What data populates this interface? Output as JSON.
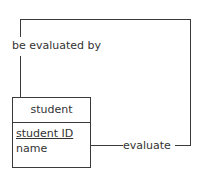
{
  "diagram": {
    "type": "entity-relationship",
    "entity": {
      "name": "student",
      "attributes": [
        {
          "name": "student ID",
          "primary_key": true
        },
        {
          "name": "name",
          "primary_key": false
        }
      ]
    },
    "relationship": {
      "kind": "recursive",
      "forward_label": "evaluate",
      "reverse_label": "be evaluated by"
    },
    "colors": {
      "line": "#3a3a3a",
      "text": "#333333",
      "background": "#ffffff"
    }
  }
}
